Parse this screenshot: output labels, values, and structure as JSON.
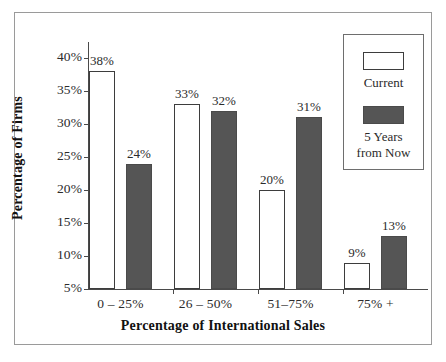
{
  "chart_data": {
    "type": "bar",
    "title": "",
    "xlabel": "Percentage of International Sales",
    "ylabel": "Percentage of Firms",
    "categories": [
      "0 – 25%",
      "26 – 50%",
      "51–75%",
      "75% +"
    ],
    "series": [
      {
        "name": "Current",
        "color": "#ffffff",
        "values": [
          38,
          33,
          20,
          9
        ],
        "value_labels": [
          "38%",
          "33%",
          "20%",
          "9%"
        ]
      },
      {
        "name": "5 Years from Now",
        "color": "#555555",
        "values": [
          24,
          32,
          31,
          13
        ],
        "value_labels": [
          "24%",
          "32%",
          "31%",
          "13%"
        ]
      }
    ],
    "ylim": [
      5,
      40
    ],
    "yticks": [
      5,
      10,
      15,
      20,
      25,
      30,
      35,
      40
    ],
    "ytick_labels": [
      "5%",
      "10%",
      "15%",
      "20%",
      "25%",
      "30%",
      "35%",
      "40%"
    ],
    "grid": false,
    "legend_position": "top-right"
  },
  "legend": {
    "entries": [
      {
        "label": "Current",
        "label_line2": "",
        "swatch": "white-swatch"
      },
      {
        "label": "5 Years",
        "label_line2": "from Now",
        "swatch": "dark-swatch"
      }
    ]
  },
  "axes": {
    "y_title": "Percentage of Firms",
    "x_title": "Percentage of International Sales"
  }
}
